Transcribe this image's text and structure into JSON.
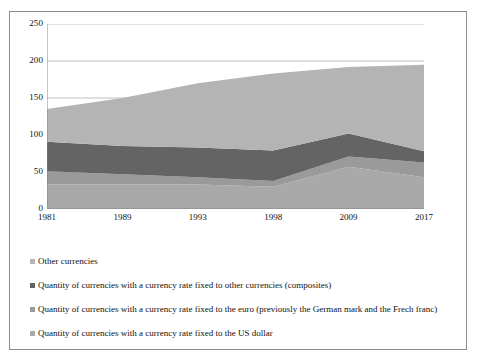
{
  "figure": {
    "background_color": "#ffffff",
    "border_color": "#8c8c8c"
  },
  "chart_data": {
    "type": "area",
    "stacked": true,
    "title": "",
    "subtitle": "",
    "xlabel": "",
    "ylabel": "",
    "categories": [
      "1981",
      "1989",
      "1993",
      "1998",
      "2009",
      "2017"
    ],
    "ylim": [
      0,
      250
    ],
    "yticks": [
      0,
      50,
      100,
      150,
      200,
      250
    ],
    "ytick_labels": [
      "0",
      "50",
      "100",
      "150",
      "200",
      "250"
    ],
    "grid": true,
    "grid_axis": "y",
    "legend_position": "below",
    "series": [
      {
        "name": "Quantity of currencies with  a currency rate  fixed to the US dollar",
        "color": "#a9a9a9",
        "stack_order": 1,
        "values": [
          33,
          33,
          33,
          30,
          57,
          43
        ]
      },
      {
        "name": "Quantity of currencies with a currency rate fixed to the euro (previously the German mark and the Frech franc)",
        "color": "#9a9a9a",
        "stack_order": 2,
        "values": [
          18,
          14,
          10,
          8,
          14,
          20
        ]
      },
      {
        "name": "Quantity of currencies with a currency rate fixed to other currencies (composites)",
        "color": "#646464",
        "stack_order": 3,
        "values": [
          40,
          38,
          40,
          41,
          31,
          15
        ]
      },
      {
        "name": "Other currencies",
        "color": "#b4b4b4",
        "stack_order": 4,
        "values": [
          44,
          65,
          87,
          104,
          90,
          117
        ]
      }
    ],
    "cumulative_totals": [
      135,
      150,
      170,
      183,
      192,
      195
    ],
    "annotations": []
  },
  "legend": {
    "items": [
      {
        "label": "Other currencies",
        "color": "#b4b4b4"
      },
      {
        "label": "Quantity of currencies with a currency rate fixed to other currencies (composites)",
        "color": "#646464"
      },
      {
        "label": "Quantity of currencies with a currency rate fixed to the euro (previously the German mark and the Frech franc)",
        "color": "#9a9a9a"
      },
      {
        "label": "Quantity of currencies with  a currency rate  fixed to the US dollar",
        "color": "#a9a9a9"
      }
    ]
  }
}
